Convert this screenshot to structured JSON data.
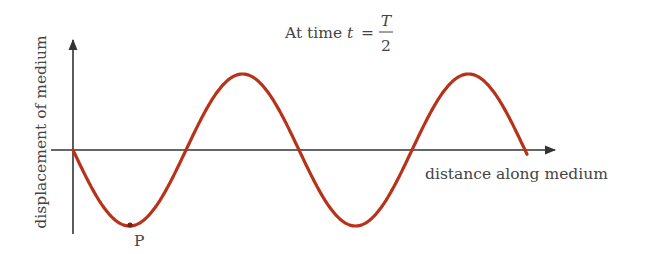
{
  "title": {
    "prefix": "At time",
    "variable": "t",
    "equals": "=",
    "numerator": "T",
    "denominator": "2"
  },
  "axes": {
    "y_label": "displacement of medium",
    "x_label": "distance along medium"
  },
  "point_label": "P",
  "colors": {
    "wave": "#b8321a",
    "axis": "#333333",
    "text": "#444444"
  },
  "wave": {
    "type": "sine",
    "origin_px": [
      73,
      150
    ],
    "wavelength_px": 226,
    "amplitude_px": 76,
    "start_phase": "downward from origin",
    "end_x_px": 527,
    "cycles": 2
  }
}
